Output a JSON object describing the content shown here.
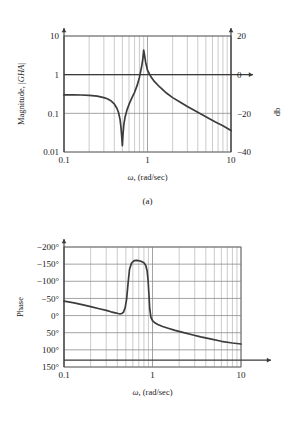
{
  "figure": {
    "panels": [
      {
        "id": "a",
        "caption": "(a)",
        "xlabel_symbol": "ω",
        "xlabel_rest": ", (rad/sec)",
        "ylabel_left": "Magnitude, |GHA|",
        "ylabel_right": "db",
        "x_ticks": [
          "0.1",
          "1",
          "10"
        ],
        "y_ticks_left": [
          "10",
          "1",
          "0.1",
          "0.01"
        ],
        "y_ticks_right": [
          "20",
          "0",
          "−20",
          "−40"
        ]
      },
      {
        "id": "b",
        "caption": "(b)",
        "xlabel_symbol": "ω",
        "xlabel_rest": ", (rad/sec)",
        "ylabel_left": "Phase",
        "x_ticks": [
          "0.1",
          "1",
          "10"
        ],
        "y_ticks_left": [
          "150°",
          "100°",
          "50°",
          "0°",
          "−50°",
          "−100°",
          "−150°",
          "−200°"
        ]
      }
    ]
  },
  "chart_data": [
    {
      "type": "line",
      "title": "Magnitude, |GHA| versus frequency",
      "xlabel": "ω, (rad/sec)",
      "ylabel": "Magnitude, |GHA|",
      "ylabel_secondary": "db",
      "xscale": "log",
      "yscale": "log",
      "xlim": [
        0.1,
        10
      ],
      "ylim": [
        0.01,
        10
      ],
      "ylim_secondary_db": [
        -40,
        20
      ],
      "xticks": [
        0.1,
        1,
        10
      ],
      "yticks": [
        0.01,
        0.1,
        1,
        10
      ],
      "yticks_secondary": [
        -40,
        -20,
        0,
        20
      ],
      "grid": true,
      "legend": "none",
      "series": [
        {
          "name": "|GHA|",
          "x": [
            0.1,
            0.13,
            0.16,
            0.2,
            0.25,
            0.3,
            0.33,
            0.36,
            0.4,
            0.43,
            0.45,
            0.47,
            0.48,
            0.49,
            0.5,
            0.51,
            0.52,
            0.54,
            0.57,
            0.6,
            0.65,
            0.7,
            0.75,
            0.8,
            0.85,
            0.88,
            0.9,
            0.92,
            0.95,
            1.0,
            1.1,
            1.2,
            1.4,
            1.7,
            2.0,
            2.5,
            3.0,
            4.0,
            5.0,
            6.5,
            8.0,
            10.0
          ],
          "y": [
            0.3,
            0.3,
            0.298,
            0.292,
            0.278,
            0.255,
            0.238,
            0.215,
            0.175,
            0.135,
            0.105,
            0.068,
            0.046,
            0.027,
            0.0145,
            0.03,
            0.05,
            0.082,
            0.125,
            0.17,
            0.25,
            0.35,
            0.52,
            0.85,
            1.6,
            2.6,
            4.3,
            3.3,
            2.1,
            1.3,
            0.88,
            0.68,
            0.48,
            0.33,
            0.255,
            0.19,
            0.15,
            0.107,
            0.082,
            0.06,
            0.048,
            0.036
          ]
        }
      ]
    },
    {
      "type": "line",
      "title": "Phase versus frequency",
      "xlabel": "ω, (rad/sec)",
      "ylabel": "Phase",
      "xscale": "log",
      "yscale": "linear",
      "xlim": [
        0.1,
        10
      ],
      "ylim": [
        -200,
        150
      ],
      "xticks": [
        0.1,
        1,
        10
      ],
      "yticks": [
        150,
        100,
        50,
        0,
        -50,
        -100,
        -150,
        -200
      ],
      "grid": true,
      "legend": "none",
      "units": "degrees",
      "series": [
        {
          "name": "Phase",
          "x": [
            0.1,
            0.13,
            0.16,
            0.2,
            0.25,
            0.3,
            0.34,
            0.38,
            0.41,
            0.43,
            0.45,
            0.47,
            0.49,
            0.51,
            0.53,
            0.55,
            0.58,
            0.62,
            0.66,
            0.7,
            0.75,
            0.8,
            0.84,
            0.87,
            0.89,
            0.91,
            0.93,
            0.96,
            1.0,
            1.05,
            1.15,
            1.3,
            1.5,
            1.8,
            2.2,
            2.8,
            3.5,
            4.5,
            6.0,
            8.0,
            10.0
          ],
          "y": [
            -8,
            -13,
            -18,
            -24,
            -30,
            -35,
            -39,
            -42,
            -44,
            -45,
            -44,
            -40,
            -28,
            -2,
            45,
            85,
            103,
            110,
            111,
            110,
            108,
            104,
            96,
            80,
            55,
            15,
            -30,
            -55,
            -65,
            -70,
            -76,
            -82,
            -87,
            -93,
            -99,
            -106,
            -112,
            -118,
            -125,
            -130,
            -133
          ]
        }
      ]
    }
  ]
}
